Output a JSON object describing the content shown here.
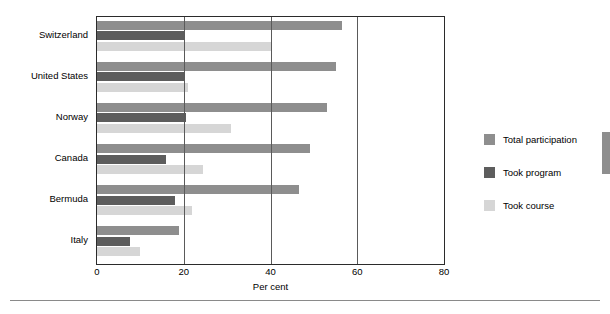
{
  "chart_data": {
    "type": "bar",
    "orientation": "horizontal",
    "title": "",
    "xlabel": "Per  cent",
    "ylabel": "",
    "xlim": [
      0,
      80
    ],
    "xticks": [
      0,
      20,
      40,
      60,
      80
    ],
    "grid": true,
    "grid_axis": "x",
    "legend_position": "right",
    "categories": [
      "Switzerland",
      "United States",
      "Norway",
      "Canada",
      "Bermuda",
      "Italy"
    ],
    "series": [
      {
        "name": "Total participation",
        "color": "#8e8e8e",
        "values": [
          56.5,
          55.0,
          53.0,
          49.0,
          46.5,
          19.0
        ]
      },
      {
        "name": "Took program",
        "color": "#5d5d5d",
        "values": [
          20.0,
          20.0,
          20.5,
          16.0,
          18.0,
          7.5
        ]
      },
      {
        "name": "Took course",
        "color": "#d6d6d6",
        "values": [
          40.0,
          21.0,
          31.0,
          24.5,
          22.0,
          10.0
        ]
      }
    ]
  },
  "axis": {
    "tick_labels": [
      "0",
      "20",
      "40",
      "60",
      "80"
    ],
    "x_title": "Per  cent"
  },
  "legend": {
    "items": [
      {
        "label": "Total participation",
        "color": "#8e8e8e"
      },
      {
        "label": "Took program",
        "color": "#5d5d5d"
      },
      {
        "label": "Took course",
        "color": "#d6d6d6"
      }
    ]
  }
}
